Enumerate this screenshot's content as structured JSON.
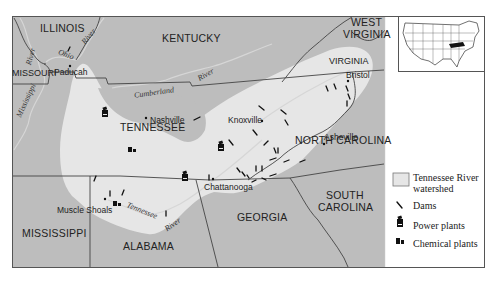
{
  "map": {
    "states": [
      {
        "name": "ILLINOIS",
        "x": 40,
        "y": 22
      },
      {
        "name": "KENTUCKY",
        "x": 162,
        "y": 32
      },
      {
        "name": "WEST",
        "x": 351,
        "y": 18
      },
      {
        "name": "VIRGINIA",
        "x": 343,
        "y": 30
      },
      {
        "name": "VIRGINIA",
        "x": 329,
        "y": 56
      },
      {
        "name": "MISSOURI",
        "x": 12,
        "y": 68
      },
      {
        "name": "TENNESSEE",
        "x": 120,
        "y": 123
      },
      {
        "name": "NORTH CAROLINA",
        "x": 295,
        "y": 136
      },
      {
        "name": "SOUTH",
        "x": 326,
        "y": 191
      },
      {
        "name": "CAROLINA",
        "x": 318,
        "y": 203
      },
      {
        "name": "GEORGIA",
        "x": 237,
        "y": 212
      },
      {
        "name": "MISSISSIPPI",
        "x": 22,
        "y": 228
      },
      {
        "name": "ALABAMA",
        "x": 123,
        "y": 240
      }
    ],
    "cities": [
      {
        "name": "Paducah",
        "x": 54,
        "y": 67,
        "dot_x": 68,
        "dot_y": 65
      },
      {
        "name": "Nashville",
        "x": 152,
        "y": 115,
        "dot_x": 146,
        "dot_y": 118
      },
      {
        "name": "Knoxville",
        "x": 228,
        "y": 115,
        "dot_x": 262,
        "dot_y": 121
      },
      {
        "name": "Bristol",
        "x": 347,
        "y": 71,
        "dot_x": 348,
        "dot_y": 81
      },
      {
        "name": "Asheville",
        "x": 325,
        "y": 132,
        "dot_x": 324,
        "dot_y": 144
      },
      {
        "name": "Chattanooga",
        "x": 204,
        "y": 182,
        "dot_x": 211,
        "dot_y": 179
      },
      {
        "name": "Muscle Shoals",
        "x": 57,
        "y": 206,
        "dot_x": 105,
        "dot_y": 199
      }
    ],
    "rivers": [
      {
        "name": "Ohio",
        "x": 58,
        "y": 52,
        "rotate": 20
      },
      {
        "name": "River",
        "x": 80,
        "y": 34,
        "rotate": -50
      },
      {
        "name": "River",
        "x": 25,
        "y": 54,
        "rotate": -75
      },
      {
        "name": "Mississippi",
        "x": 16,
        "y": 96,
        "rotate": -65
      },
      {
        "name": "Cumberland",
        "x": 134,
        "y": 89,
        "rotate": -8
      },
      {
        "name": "River",
        "x": 197,
        "y": 72,
        "rotate": -30
      },
      {
        "name": "Tennessee",
        "x": 126,
        "y": 208,
        "rotate": 20
      },
      {
        "name": "River",
        "x": 166,
        "y": 222,
        "rotate": -35
      }
    ]
  },
  "legend": {
    "items": [
      {
        "icon": "watershed-swatch-icon",
        "label_line1": "Tennessee River",
        "label_line2": "watershed"
      },
      {
        "icon": "dam-icon",
        "label_line1": "Dams"
      },
      {
        "icon": "power-plant-icon",
        "label_line1": "Power plants"
      },
      {
        "icon": "chemical-plant-icon",
        "label_line1": "Chemical plants"
      }
    ]
  },
  "colors": {
    "land": "#bdbdbd",
    "watershed": "#e6e6e6",
    "border": "#444444",
    "river": "#d4d4d4",
    "legend_bg": "#ffffff"
  }
}
